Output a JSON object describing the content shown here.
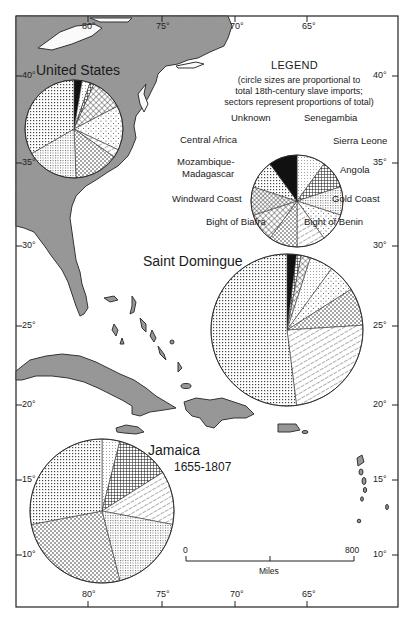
{
  "map": {
    "frame": {
      "left": 16,
      "top": 16,
      "right": 398,
      "bottom": 607
    },
    "land_color": "#9a9a9a",
    "coast_color": "#333333",
    "longitude_ticks": [
      {
        "label": "80°",
        "x": 88
      },
      {
        "label": "75°",
        "x": 162
      },
      {
        "label": "70°",
        "x": 235
      },
      {
        "label": "65°",
        "x": 307
      }
    ],
    "latitude_ticks_left": [
      {
        "label": "40°",
        "y": 76
      },
      {
        "label": "35°",
        "y": 163
      },
      {
        "label": "30°",
        "y": 246
      },
      {
        "label": "25°",
        "y": 326
      },
      {
        "label": "20°",
        "y": 405
      },
      {
        "label": "15°",
        "y": 480
      },
      {
        "label": "10°",
        "y": 555
      }
    ],
    "latitude_ticks_right": [
      {
        "label": "40°",
        "y": 76
      },
      {
        "label": "35°",
        "y": 163
      },
      {
        "label": "30°",
        "y": 246
      },
      {
        "label": "25°",
        "y": 326
      },
      {
        "label": "20°",
        "y": 405
      },
      {
        "label": "15°",
        "y": 480
      },
      {
        "label": "10°",
        "y": 555
      }
    ]
  },
  "legend": {
    "title": "LEGEND",
    "note_line1": "(circle sizes are proportional to",
    "note_line2": "total 18th-century slave imports;",
    "note_line3": "sectors represent proportions of total)",
    "labels": {
      "unknown": "Unknown",
      "senegambia": "Senegambia",
      "central_africa": "Central Africa",
      "sierra_leone": "Sierra Leone",
      "mozambique1": "Mozambique-",
      "mozambique2": "Madagascar",
      "angola": "Angola",
      "windward": "Windward Coast",
      "gold_coast": "Gold Coast",
      "biafra": "Bight of Biafra",
      "benin": "Bight of Benin"
    }
  },
  "regions": {
    "united_states": {
      "label": "United States"
    },
    "saint_domingue": {
      "label": "Saint Domingue"
    },
    "jamaica": {
      "label": "Jamaica",
      "years": "1655-1807"
    }
  },
  "scale_bar": {
    "start": "0",
    "end": "800",
    "unit": "Miles"
  },
  "chart_data": [
    {
      "type": "pie",
      "title": "Legend",
      "categories": [
        "Senegambia",
        "Sierra Leone",
        "Angola",
        "Gold Coast",
        "Bight of Benin",
        "Bight of Biafra",
        "Windward Coast",
        "Mozambique-Madagascar",
        "Central Africa",
        "Unknown"
      ],
      "values": [
        10,
        10,
        10,
        10,
        10,
        10,
        10,
        10,
        10,
        10
      ],
      "center": [
        297,
        201
      ],
      "radius": 46
    },
    {
      "type": "pie",
      "title": "United States",
      "categories": [
        "Unknown",
        "Senegambia",
        "Sierra Leone",
        "Windward Coast",
        "Gold Coast",
        "Bight of Benin",
        "Bight of Biafra",
        "Angola",
        "Central Africa"
      ],
      "values": [
        2,
        2,
        1,
        8,
        11,
        2,
        11,
        13,
        25
      ],
      "note": "approximate; estimated from sector angles",
      "center": [
        74,
        129
      ],
      "radius": 49
    },
    {
      "type": "pie",
      "title": "Saint Domingue",
      "categories": [
        "Unknown",
        "Sierra Leone",
        "Windward Coast",
        "Senegambia",
        "Gold Coast",
        "Bight of Biafra",
        "Bight of Benin",
        "Central Africa"
      ],
      "values": [
        2,
        1,
        2,
        5,
        6,
        8,
        24,
        52
      ],
      "note": "approximate; estimated from sector angles",
      "center": [
        287,
        330
      ],
      "radius": 76
    },
    {
      "type": "pie",
      "title": "Jamaica 1655-1807",
      "categories": [
        "Senegambia",
        "Sierra Leone",
        "Bight of Benin",
        "Angola",
        "Bight of Biafra",
        "Central Africa"
      ],
      "values": [
        4,
        12,
        12,
        18,
        26,
        28
      ],
      "note": "approximate; estimated from sector angles",
      "center": [
        102,
        511
      ],
      "radius": 72
    }
  ]
}
